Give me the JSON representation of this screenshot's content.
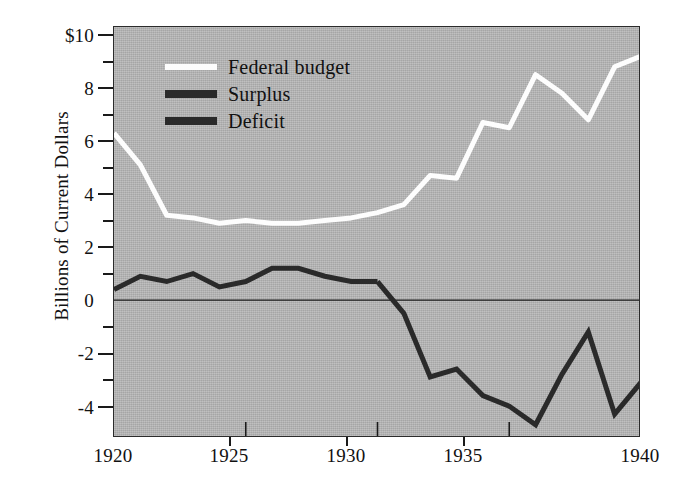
{
  "chart_data": {
    "type": "line",
    "title": "",
    "subtitle": "",
    "xlabel": "",
    "ylabel": "Billions of Current Dollars",
    "xlim": [
      1920,
      1940
    ],
    "ylim": [
      -5.2,
      10.3
    ],
    "grid": false,
    "legend_position": "top-left",
    "x_ticks": [
      "1920",
      "1925",
      "1930",
      "1935",
      "1940"
    ],
    "x_tick_values": [
      1920,
      1925,
      1930,
      1935,
      1940
    ],
    "y_ticks": [
      "$10",
      "8",
      "6",
      "4",
      "2",
      "0",
      "-2",
      "-4"
    ],
    "y_tick_values": [
      10,
      8,
      6,
      4,
      2,
      0,
      -2,
      -4
    ],
    "y_minor_tick_values": [
      9,
      7,
      5,
      3,
      1,
      -1,
      -3
    ],
    "zero_line": 0,
    "plot_background_color": "#b6b6b6",
    "axis_color": "#2b2b2b",
    "x": [
      1920,
      1921,
      1922,
      1923,
      1924,
      1925,
      1926,
      1927,
      1928,
      1929,
      1930,
      1931,
      1932,
      1933,
      1934,
      1935,
      1936,
      1937,
      1938,
      1939,
      1940
    ],
    "series": [
      {
        "name": "Federal budget",
        "color": "#fdfdfd",
        "width": 5,
        "values": [
          6.3,
          5.1,
          3.2,
          3.1,
          2.9,
          3.0,
          2.9,
          2.9,
          3.0,
          3.1,
          3.3,
          3.6,
          4.7,
          4.6,
          6.7,
          6.5,
          8.5,
          7.8,
          6.8,
          8.8,
          9.2
        ]
      },
      {
        "name": "Surplus",
        "color": "#2a2a2a",
        "width": 5,
        "values": [
          0.4,
          0.9,
          0.7,
          1.0,
          0.5,
          0.7,
          1.2,
          1.2,
          0.9,
          0.7,
          0.7,
          null,
          null,
          null,
          null,
          null,
          null,
          null,
          null,
          null,
          null
        ]
      },
      {
        "name": "Deficit",
        "color": "#2a2a2a",
        "width": 5,
        "values": [
          null,
          null,
          null,
          null,
          null,
          null,
          null,
          null,
          null,
          null,
          0.7,
          -0.5,
          -2.9,
          -2.6,
          -3.6,
          -4.0,
          -4.7,
          -2.8,
          -1.2,
          -4.3,
          -3.1
        ]
      }
    ],
    "legend": [
      {
        "label": "Federal budget",
        "color": "#fdfdfd"
      },
      {
        "label": "Surplus",
        "color": "#2a2a2a"
      },
      {
        "label": "Deficit",
        "color": "#2a2a2a"
      }
    ]
  }
}
